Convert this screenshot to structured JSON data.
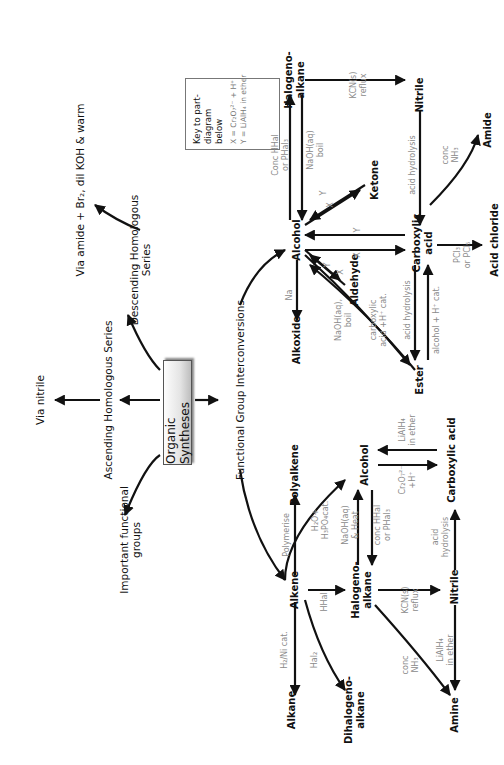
{
  "title": "Organic Syntheses",
  "top_branches": {
    "via_nitrile": "Via nitrile",
    "ascending": "Ascending Homologous Series",
    "important_groups_l1": "Important functional",
    "important_groups_l2": "groups",
    "descending_l1": "Descending Homologous",
    "descending_l2": "Series",
    "via_amide": "Via amide + Br₂, dil KOH & warm",
    "functional_group_interconversions": "Functional   Group   Interconversions"
  },
  "key": {
    "heading_l1": "Key to part-",
    "heading_l2": "diagram below",
    "x_def": "X = Cr₂O₇²⁻ + H⁺",
    "y_def": "Y = LiAlH₄ in ether"
  },
  "left_diagram": {
    "nodes": {
      "alkene": "Alkene",
      "alkane": "Alkane",
      "dihalogenoalkane_l1": "Dihalogeno-",
      "dihalogenoalkane_l2": "alkane",
      "halogenoalkane_l1": "Halogeno-",
      "halogenoalkane_l2": "alkane",
      "amine": "Amine",
      "nitrile": "Nitrile",
      "carboxylic_acid": "Carboxylic acid",
      "alcohol": "Alcohol",
      "polyalkene": "Polyalkene"
    },
    "conditions": {
      "h2_ni": "H₂/Ni cat.",
      "hal2": "Hal₂",
      "hhal": "HHal",
      "polymerise": "Polymerise",
      "hydration_l1": "H₂O+",
      "hydration_l2": "H₃PO₄cat.",
      "naoh_heat_l1": "NaOH(aq)",
      "naoh_heat_l2": "& Heat",
      "conc_hhal_l1": "conc HHal",
      "conc_hhal_l2": "or PHal₃",
      "kcn_l1": "KCN(s)",
      "kcn_l2": "reflux",
      "conc_nh3_l1": "conc",
      "conc_nh3_l2": "NH₃",
      "lialh4_amine_l1": "LiAlH₄",
      "lialh4_amine_l2": "in ether",
      "acid_hydrolysis_l1": "acid",
      "acid_hydrolysis_l2": "hydrolysis",
      "oxidation_l1": "Cr₂O₇²⁻",
      "oxidation_l2": "+H⁺",
      "lialh4_acid_l1": "LiAlH₄",
      "lialh4_acid_l2": "in ether"
    }
  },
  "right_diagram": {
    "nodes": {
      "alcohol": "Alcohol",
      "alkoxide": "Alkoxide",
      "aldehyde": "Aldehyde",
      "ketone": "Ketone",
      "halogenoalkane_l1": "Halogeno-",
      "halogenoalkane_l2": "alkane",
      "nitrile": "Nitrile",
      "carboxylic_acid_l1": "Carboxylic",
      "carboxylic_acid_l2": "acid",
      "ester": "Ester",
      "amide": "Amide",
      "acid_chloride": "Acid chloride"
    },
    "conditions": {
      "na": "Na",
      "naoh_boil_l1": "NaOH(aq),",
      "naoh_boil_l2": "boil",
      "carboxylic_cat_l1": "carboxylic",
      "carboxylic_cat_l2": "acid +H⁺ cat.",
      "conc_hhal_l1": "Conc HHal",
      "conc_hhal_l2": "or PHal₃",
      "naoh_l1": "NaOH(aq)",
      "naoh_l2": "boil",
      "kcn_l1": "KCN(s)",
      "kcn_l2": "reflux",
      "acid_hydrolysis_top": "acid hydrolysis",
      "conc_nh3_l1": "conc",
      "conc_nh3_l2": "NH₃",
      "pcl_l1": "PCl₃",
      "pcl_l2": "or PCl₅",
      "acid_hydrolysis_ester": "acid hydrolysis",
      "alcohol_cat": "alcohol + H⁺ cat.",
      "x": "X",
      "y": "Y"
    }
  }
}
